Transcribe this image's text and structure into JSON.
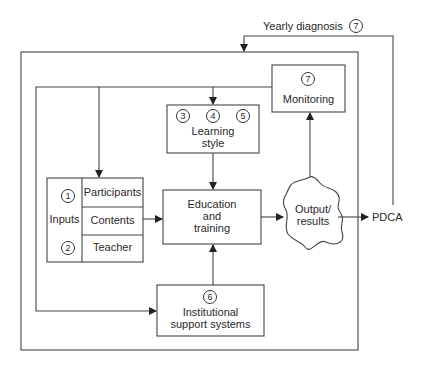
{
  "diagram": {
    "feedback_top": {
      "label": "Yearly diagnosis",
      "number": "7"
    },
    "monitoring": {
      "number": "7",
      "label": "Monitoring"
    },
    "learning_style": {
      "numbers": [
        "3",
        "4",
        "5"
      ],
      "label_line1": "Learning",
      "label_line2": "style"
    },
    "inputs": {
      "label": "Inputs",
      "numbers": [
        "1",
        "2"
      ],
      "rows": [
        "Participants",
        "Contents",
        "Teacher"
      ]
    },
    "education": {
      "line1": "Education",
      "line2": "and",
      "line3": "training"
    },
    "output": {
      "line1": "Output/",
      "line2": "results"
    },
    "pdca": {
      "label": "PDCA"
    },
    "institutional": {
      "number": "6",
      "line1": "Institutional",
      "line2": "support systems"
    },
    "colors": {
      "line": "#333333",
      "background": "#ffffff"
    }
  }
}
